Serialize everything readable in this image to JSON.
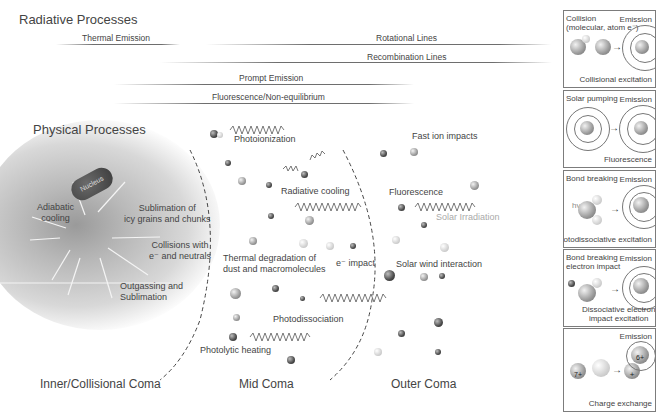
{
  "radiative": {
    "title": "Radiative Processes",
    "lines": [
      {
        "label": "Thermal Emission"
      },
      {
        "label": "Rotational Lines"
      },
      {
        "label": "Recombination Lines"
      },
      {
        "label": "Prompt Emission"
      },
      {
        "label": "Fluorescence/Non-equilibrium"
      }
    ]
  },
  "physical": {
    "title": "Physical Processes",
    "nucleus": "Nucleus",
    "inner": {
      "adiabatic": "Adiabatic\ncooling",
      "sublimation_icy": "Sublimation of\nicy grains and chunks",
      "collisions": "Collisions with\ne⁻ and neutrals",
      "outgassing": "Outgassing and\nSublimation"
    },
    "mid": {
      "photoionization": "Photoionization",
      "radiative_cooling": "Radiative cooling",
      "thermal_degradation": "Thermal degradation of\ndust and macromolecules",
      "e_impact": "e⁻ impact",
      "photodissociation": "Photodissociation",
      "photolytic_heating": "Photolytic heating"
    },
    "outer": {
      "fast_ion": "Fast ion impacts",
      "fluorescence": "Fluorescence",
      "solar_irradiation": "Solar Irradiation",
      "solar_wind": "Solar wind interaction"
    }
  },
  "zones": {
    "inner": "Inner/Collisional Coma",
    "mid": "Mid Coma",
    "outer": "Outer Coma"
  },
  "panels": [
    {
      "top_left": "Collision\n(molecular, atom e⁻)",
      "emission": "Emission",
      "bottom": "Collisional excitation"
    },
    {
      "top_left": "Solar pumping",
      "emission": "Emission",
      "bottom": "Fluorescence",
      "hv": "hv"
    },
    {
      "top_left": "Bond breaking",
      "emission": "Emission",
      "bottom": "Photodissociative excitation",
      "hv": "hv"
    },
    {
      "top_left": "Bond breaking\nelectron impact",
      "emission": "Emission",
      "bottom": "Dissociative electron\nimpact excitation",
      "e": "e⁻"
    },
    {
      "emission": "Emission",
      "bottom": "Charge exchange",
      "ion_in": "7+",
      "ion_out": "6+",
      "plus": "+"
    }
  ]
}
